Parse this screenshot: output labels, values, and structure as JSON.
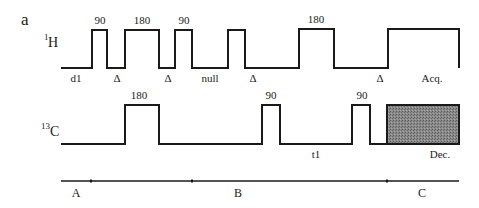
{
  "figure": {
    "panel_label": "a",
    "background": "#ffffff",
    "line_color": "#1a1a1a",
    "decoupling_fill": "#7a7a7a"
  },
  "channels": {
    "h": {
      "label_sup": "1",
      "label_main": "H",
      "pulses": [
        {
          "angle": "90"
        },
        {
          "angle": "180"
        },
        {
          "angle": "90"
        },
        {
          "angle": ""
        },
        {
          "angle": "180"
        }
      ],
      "delays": {
        "d1": "d1",
        "delta1": "Δ",
        "delta2": "Δ",
        "null": "null",
        "delta3": "Δ",
        "delta4": "Δ"
      },
      "acquisition": "Acq."
    },
    "c": {
      "label_sup": "13",
      "label_main": "C",
      "pulses": [
        {
          "angle": "180"
        },
        {
          "angle": "90"
        },
        {
          "angle": "90"
        }
      ],
      "evolution": "t1",
      "decoupling": "Dec."
    }
  },
  "timeline": {
    "segments": [
      {
        "label": "A"
      },
      {
        "label": "B"
      },
      {
        "label": "C"
      }
    ]
  }
}
